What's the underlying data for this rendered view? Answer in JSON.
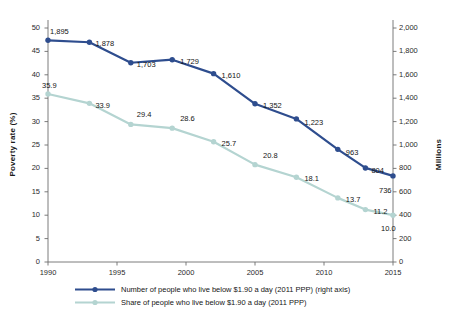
{
  "chart_data": {
    "type": "line",
    "title": "",
    "xlabel": "",
    "x": [
      1990,
      1993,
      1996,
      1999,
      2002,
      2005,
      2008,
      2011,
      2013,
      2015
    ],
    "xtick_labels": [
      "1990",
      "1995",
      "2000",
      "2005",
      "2010",
      "2015"
    ],
    "xticks": [
      1990,
      1995,
      2000,
      2005,
      2010,
      2015
    ],
    "xlim": [
      1990,
      2015
    ],
    "grid": false,
    "legend_position": "bottom",
    "axes": [
      {
        "id": "left",
        "label": "Poverty rate (%)",
        "lim": [
          0,
          50
        ],
        "ticks": [
          0,
          5,
          10,
          15,
          20,
          25,
          30,
          35,
          40,
          45,
          50
        ],
        "tick_labels": [
          "0",
          "5",
          "10",
          "15",
          "20",
          "25",
          "30",
          "35",
          "40",
          "45",
          "50"
        ]
      },
      {
        "id": "right",
        "label": "Millions",
        "lim": [
          0,
          2000
        ],
        "ticks": [
          0,
          200,
          400,
          600,
          800,
          1000,
          1200,
          1400,
          1600,
          1800,
          2000
        ],
        "tick_labels": [
          "0",
          "200",
          "400",
          "600",
          "800",
          "1,000",
          "1,200",
          "1,400",
          "1,600",
          "1,800",
          "2,000"
        ]
      }
    ],
    "series": [
      {
        "name": "Number of people who live below $1.90 a day (2011 PPP) (right axis)",
        "axis": "right",
        "color": "#2e4d8e",
        "values": [
          1895,
          1878,
          1703,
          1729,
          1610,
          1352,
          1223,
          963,
          804,
          736
        ],
        "point_labels": [
          "1,895",
          "1,878",
          "1,703",
          "1,729",
          "1,610",
          "1,352",
          "1,223",
          "963",
          "804",
          "736"
        ]
      },
      {
        "name": "Share of people who live below $1.90 a day (2011 PPP)",
        "axis": "left",
        "color": "#b4d4d1",
        "values": [
          35.9,
          33.9,
          29.4,
          28.6,
          25.7,
          20.8,
          18.1,
          13.7,
          11.2,
          10.0
        ],
        "point_labels": [
          "35.9",
          "33.9",
          "29.4",
          "28.6",
          "25.7",
          "20.8",
          "18.1",
          "13.7",
          "11.2",
          "10.0"
        ]
      }
    ]
  },
  "legend": {
    "items": [
      {
        "label": "Number of people who live below $1.90 a day (2011 PPP) (right axis)",
        "color": "#2e4d8e"
      },
      {
        "label": "Share of people who live below $1.90 a day (2011 PPP)",
        "color": "#b4d4d1"
      }
    ]
  },
  "colors": {
    "series_number": "#2e4d8e",
    "series_share": "#b4d4d1",
    "axis": "#6d6d6d",
    "text": "#151515",
    "background": "#ffffff"
  }
}
